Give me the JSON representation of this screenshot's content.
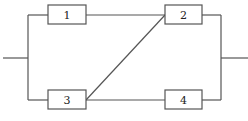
{
  "diagram": {
    "type": "reliability-block-diagram",
    "blocks": [
      {
        "id": "1",
        "label": "1",
        "x": 48,
        "y": 5,
        "w": 38,
        "h": 19
      },
      {
        "id": "2",
        "label": "2",
        "x": 165,
        "y": 5,
        "w": 37,
        "h": 19
      },
      {
        "id": "3",
        "label": "3",
        "x": 48,
        "y": 90,
        "w": 38,
        "h": 19
      },
      {
        "id": "4",
        "label": "4",
        "x": 165,
        "y": 90,
        "w": 37,
        "h": 19
      }
    ],
    "connections": [
      {
        "from": "input",
        "to": "1"
      },
      {
        "from": "input",
        "to": "3"
      },
      {
        "from": "1",
        "to": "2"
      },
      {
        "from": "3",
        "to": "2"
      },
      {
        "from": "3",
        "to": "4"
      },
      {
        "from": "2",
        "to": "output"
      },
      {
        "from": "4",
        "to": "output"
      }
    ],
    "colors": {
      "line": "#555555",
      "text": "#222222",
      "background": "#ffffff"
    }
  }
}
